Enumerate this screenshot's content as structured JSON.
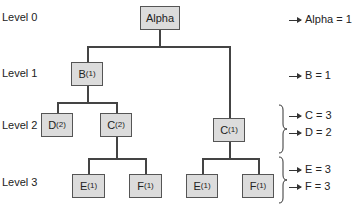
{
  "levels": [
    "Level 0",
    "Level 1",
    "Level 2",
    "Level 3"
  ],
  "nodes": {
    "alpha": {
      "label": "Alpha",
      "sub": ""
    },
    "b": {
      "label": "B",
      "sub": "(1)"
    },
    "d": {
      "label": "D",
      "sub": "(2)"
    },
    "c_left": {
      "label": "C",
      "sub": "(2)"
    },
    "c_right": {
      "label": "C",
      "sub": "(1)"
    },
    "e_left": {
      "label": "E",
      "sub": "(1)"
    },
    "f_left": {
      "label": "F",
      "sub": "(1)"
    },
    "e_right": {
      "label": "E",
      "sub": "(1)"
    },
    "f_right": {
      "label": "F",
      "sub": "(1)"
    }
  },
  "results": [
    "Alpha = 1",
    "B = 1",
    "C = 3",
    "D = 2",
    "E = 3",
    "F = 3"
  ]
}
